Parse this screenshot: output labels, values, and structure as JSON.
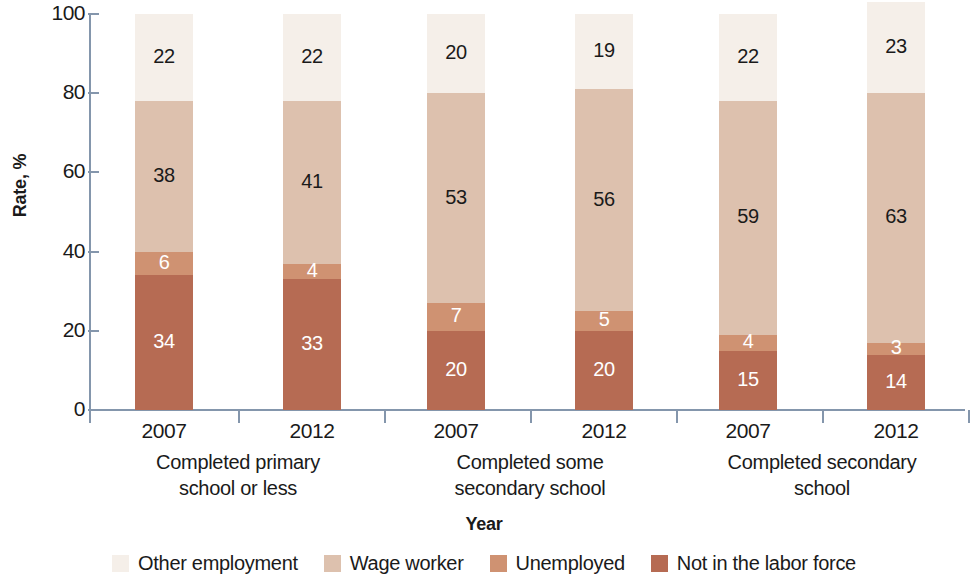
{
  "chart_data": {
    "type": "bar",
    "subtype": "stacked-bar",
    "title": "",
    "xlabel": "Year",
    "ylabel": "Rate, %",
    "ylim": [
      0,
      100
    ],
    "yticks": [
      0,
      20,
      40,
      60,
      80,
      100
    ],
    "grid": false,
    "legend_position": "bottom",
    "categories": [
      "2007",
      "2012",
      "2007",
      "2012",
      "2007",
      "2012"
    ],
    "groups": [
      {
        "label": "Completed primary\nschool or less",
        "line1": "Completed primary",
        "line2": "school or less",
        "years": [
          "2007",
          "2012"
        ]
      },
      {
        "label": "Completed some\nsecondary school",
        "line1": "Completed some",
        "line2": "secondary school",
        "years": [
          "2007",
          "2012"
        ]
      },
      {
        "label": "Completed secondary\nschool",
        "line1": "Completed secondary",
        "line2": "school",
        "years": [
          "2007",
          "2012"
        ]
      }
    ],
    "series": [
      {
        "name": "Not in the labor force",
        "color": "#b66b53",
        "label_color": "#ffffff",
        "values": [
          34,
          33,
          20,
          20,
          15,
          14
        ]
      },
      {
        "name": "Unemployed",
        "color": "#cf9272",
        "label_color": "#ffffff",
        "values": [
          6,
          4,
          7,
          5,
          4,
          3
        ]
      },
      {
        "name": "Wage worker",
        "color": "#ddc1ae",
        "label_color": "#1a1a1a",
        "values": [
          38,
          41,
          53,
          56,
          59,
          63
        ]
      },
      {
        "name": "Other employment",
        "color": "#f5efe9",
        "label_color": "#1a1a1a",
        "values": [
          22,
          22,
          20,
          19,
          22,
          23
        ]
      }
    ],
    "bar_totals": [
      100,
      100,
      100,
      100,
      100,
      100
    ],
    "axis_color": "#8496ac"
  },
  "legend": {
    "items": [
      {
        "label": "Other employment",
        "color": "#f5efe9"
      },
      {
        "label": "Wage worker",
        "color": "#ddc1ae"
      },
      {
        "label": "Unemployed",
        "color": "#cf9272"
      },
      {
        "label": "Not in the labor force",
        "color": "#b66b53"
      }
    ]
  },
  "axis": {
    "y_title": "Rate, %",
    "x_title": "Year",
    "y_ticks": [
      "100",
      "80",
      "60",
      "40",
      "20",
      "0"
    ]
  }
}
